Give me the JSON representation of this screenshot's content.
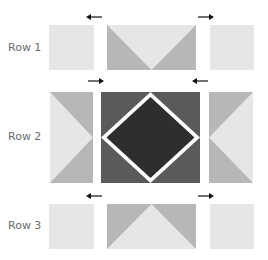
{
  "rows": [
    {
      "label": "Row 1"
    },
    {
      "label": "Row 2"
    },
    {
      "label": "Row 3"
    }
  ],
  "colors": {
    "light": "#e6e6e6",
    "medium": "#b7b7b7",
    "dark_block": "#5a5a5a",
    "darkest": "#2e2e2e",
    "white": "#ffffff",
    "arrow": "#111111",
    "label": "#6b6b6b"
  },
  "arrows": [
    {
      "row_gap": "above-row-1",
      "direction": "left"
    },
    {
      "row_gap": "above-row-1",
      "direction": "right"
    },
    {
      "row_gap": "between-row-1-2",
      "direction": "right"
    },
    {
      "row_gap": "between-row-1-2",
      "direction": "left"
    },
    {
      "row_gap": "between-row-2-3",
      "direction": "left"
    },
    {
      "row_gap": "between-row-2-3",
      "direction": "right"
    }
  ]
}
